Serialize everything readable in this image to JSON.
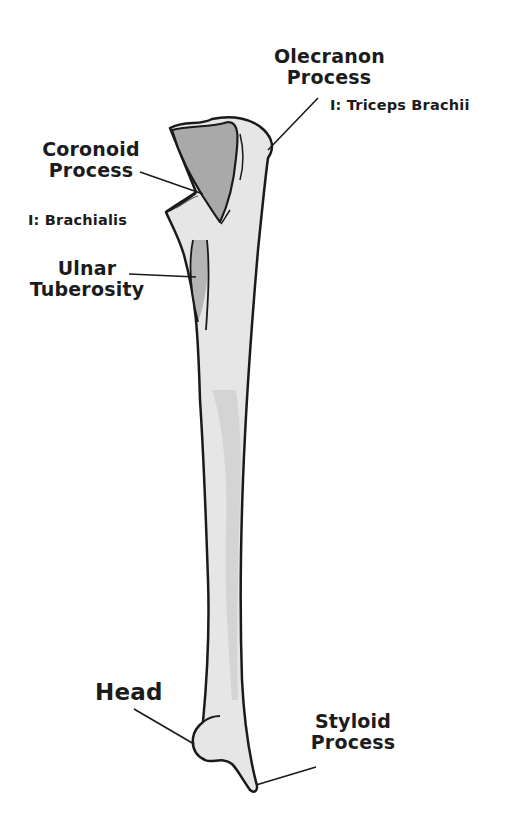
{
  "diagram": {
    "subject": "Ulna",
    "colors": {
      "outline": "#1a1a1a",
      "bone_fill": "#e6e6e6",
      "shade_fill": "#a9a9a9",
      "background": "#ffffff",
      "text": "#1c1c1c"
    },
    "labels": {
      "olecranon": {
        "line1": "Olecranon",
        "line2": "Process",
        "insertion": "I: Triceps Brachii"
      },
      "coronoid": {
        "line1": "Coronoid",
        "line2": "Process",
        "insertion": "I: Brachialis"
      },
      "ulnar_tuberosity": {
        "line1": "Ulnar",
        "line2": "Tuberosity"
      },
      "head": {
        "line1": "Head"
      },
      "styloid": {
        "line1": "Styloid",
        "line2": "Process"
      }
    }
  }
}
